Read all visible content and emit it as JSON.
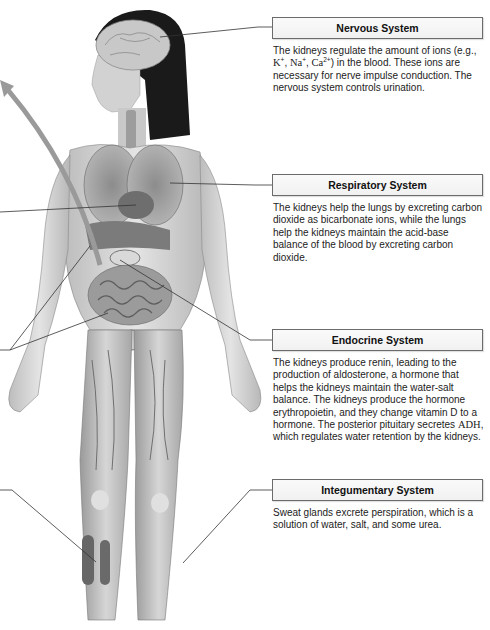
{
  "figure": {
    "arrow": "curved gray arrow pointing up-left from abdomen"
  },
  "callouts": [
    {
      "id": "nervous",
      "title": "Nervous System",
      "body_parts": {
        "p1": "The kidneys regulate the amount of ions (e.g., ",
        "k": "K",
        "k_sup": "+",
        "sep1": ", ",
        "na": "Na",
        "na_sup": "+",
        "sep2": ", ",
        "ca": "Ca",
        "ca_sup": "2+",
        "p2": ") in the blood. These ions are necessary for nerve impulse conduction. The nervous system controls urination."
      }
    },
    {
      "id": "respiratory",
      "title": "Respiratory System",
      "body": "The kidneys help the lungs by excreting carbon dioxide as bicarbonate ions, while the lungs help the kidneys maintain the acid-base balance of the blood by excreting carbon dioxide."
    },
    {
      "id": "endocrine",
      "title": "Endocrine System",
      "body_parts": {
        "p1": "The kidneys produce renin, leading to the production of aldosterone, a hormone that helps the kidneys maintain the water-salt balance. The kidneys produce the hormone erythropoietin, and they change vitamin D to a hormone. The posterior pituitary secretes ",
        "adh": "ADH",
        "p2": ", which regulates water retention by the kidneys."
      }
    },
    {
      "id": "integumentary",
      "title": "Integumentary System",
      "body": "Sweat glands excrete perspiration, which is a solution of water, salt, and some urea."
    }
  ],
  "colors": {
    "box_border": "#6b6b6b",
    "leader_line": "#333333",
    "arrow": "#9a9a9a",
    "background": "#ffffff"
  }
}
